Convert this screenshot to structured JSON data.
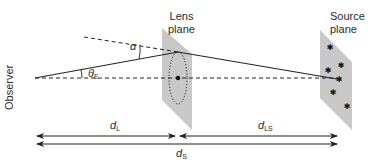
{
  "labels": {
    "lens_plane_line1": "Lens",
    "lens_plane_line2": "plane",
    "source_plane_line1": "Source",
    "source_plane_line2": "plane",
    "observer": "Observer"
  },
  "symbols": {
    "alpha": "α",
    "theta_E": "θ",
    "theta_E_sub": "E",
    "d_L": "d",
    "d_L_sub": "L",
    "d_LS": "d",
    "d_LS_sub": "LS",
    "d_S": "d",
    "d_S_sub": "S"
  },
  "colors": {
    "plane_fill": "#c8c8c8",
    "line": "#222222",
    "background": "#ffffff"
  }
}
